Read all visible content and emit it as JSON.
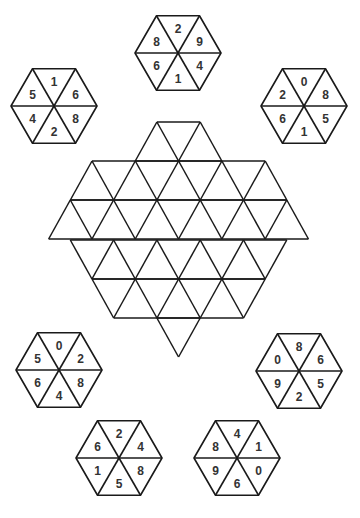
{
  "colors": {
    "line": "#1a1a1a",
    "digit": "#333333",
    "background": "#ffffff"
  },
  "hexagons": [
    {
      "id": "top",
      "cx": 178,
      "cy": 53,
      "r": 43,
      "digits": [
        "2",
        "9",
        "4",
        "1",
        "6",
        "8"
      ]
    },
    {
      "id": "top-left",
      "cx": 54,
      "cy": 106,
      "r": 43,
      "digits": [
        "1",
        "6",
        "8",
        "2",
        "4",
        "5"
      ]
    },
    {
      "id": "top-right",
      "cx": 304,
      "cy": 106,
      "r": 43,
      "digits": [
        "0",
        "8",
        "5",
        "1",
        "6",
        "2"
      ]
    },
    {
      "id": "bottom-left",
      "cx": 59,
      "cy": 370,
      "r": 43,
      "digits": [
        "0",
        "2",
        "8",
        "4",
        "6",
        "5"
      ]
    },
    {
      "id": "bottom-right",
      "cx": 299,
      "cy": 371,
      "r": 43,
      "digits": [
        "8",
        "6",
        "5",
        "2",
        "9",
        "0"
      ]
    },
    {
      "id": "bottom-center-left",
      "cx": 119,
      "cy": 458,
      "r": 43,
      "digits": [
        "2",
        "4",
        "8",
        "5",
        "1",
        "6"
      ]
    },
    {
      "id": "bottom-center-right",
      "cx": 237,
      "cy": 458,
      "r": 43,
      "digits": [
        "4",
        "1",
        "0",
        "6",
        "9",
        "8"
      ]
    }
  ],
  "grid": {
    "cx": 178.5,
    "side": 43.3,
    "row_height": 39,
    "top_y": 122,
    "rows": [
      {
        "y_top": 122,
        "start_x": 156.9,
        "count": 1
      },
      {
        "y_top": 161,
        "start_x": 92,
        "count": 4
      },
      {
        "y_top": 200,
        "start_x": 70.3,
        "count": 5
      },
      {
        "y_top": 240,
        "start_x": 70.3,
        "count": 5
      },
      {
        "y_top": 279,
        "start_x": 92,
        "count": 4
      },
      {
        "y_top": 318,
        "start_x": 156.9,
        "count": 1
      }
    ]
  }
}
